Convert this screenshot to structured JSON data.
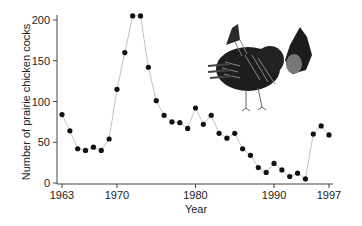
{
  "chart_data": {
    "type": "line",
    "title": "",
    "xlabel": "Year",
    "ylabel": "Number of prairie chicken cocks",
    "xlim": [
      1963,
      1997
    ],
    "ylim": [
      0,
      200
    ],
    "x_ticks": [
      1963,
      1970,
      1980,
      1990,
      1997
    ],
    "y_ticks": [
      0,
      50,
      100,
      150,
      200
    ],
    "grid": false,
    "legend": null,
    "marker": "filled-circle",
    "line_color": "#bbbbbb",
    "marker_color": "#111111",
    "x": [
      1963,
      1964,
      1965,
      1966,
      1967,
      1968,
      1969,
      1970,
      1971,
      1972,
      1973,
      1974,
      1975,
      1976,
      1977,
      1978,
      1979,
      1980,
      1981,
      1982,
      1983,
      1984,
      1985,
      1986,
      1987,
      1988,
      1989,
      1990,
      1991,
      1992,
      1993,
      1994,
      1995,
      1996,
      1997
    ],
    "series": [
      {
        "name": "Prairie chicken cocks",
        "values": [
          84,
          64,
          42,
          40,
          44,
          40,
          54,
          115,
          160,
          205,
          205,
          142,
          101,
          83,
          75,
          74,
          67,
          92,
          72,
          83,
          61,
          55,
          61,
          42,
          34,
          19,
          13,
          24,
          16,
          8,
          12,
          5,
          60,
          70,
          59
        ]
      }
    ],
    "annotations": [
      {
        "type": "illustration",
        "subject": "prairie-chicken"
      }
    ]
  }
}
